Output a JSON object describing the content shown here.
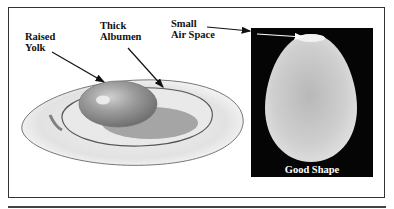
{
  "figure": {
    "labels": {
      "raised_yolk": "Raised\nYolk",
      "raised_yolk_line1": "Raised",
      "raised_yolk_line2": "Yolk",
      "thick_albumen_line1": "Thick",
      "thick_albumen_line2": "Albumen",
      "small_air_space_line1": "Small",
      "small_air_space_line2": "Air Space"
    },
    "panel_caption": "Good Shape",
    "colors": {
      "frame": "#333333",
      "panel_background": "#050505",
      "egg_shell": "#d9d9d9",
      "yolk": "#9a9a9a",
      "albumen": "#e6e6e6"
    }
  }
}
